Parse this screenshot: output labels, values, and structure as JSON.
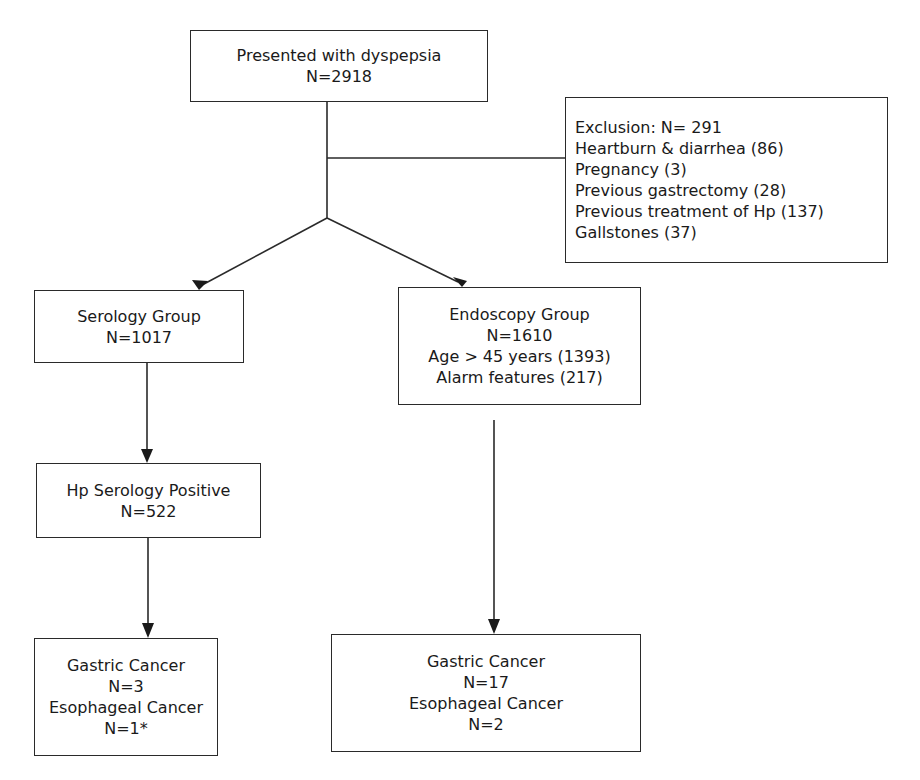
{
  "diagram": {
    "type": "flowchart",
    "nodes": {
      "start": {
        "lines": [
          "Presented with dyspepsia",
          "N=2918"
        ]
      },
      "exclusion": {
        "lines": [
          "Exclusion: N= 291",
          "Heartburn & diarrhea (86)",
          "Pregnancy (3)",
          "Previous gastrectomy (28)",
          "Previous treatment of Hp (137)",
          "Gallstones (37)"
        ]
      },
      "serology_group": {
        "lines": [
          "Serology Group",
          "N=1017"
        ]
      },
      "endoscopy_group": {
        "lines": [
          "Endoscopy Group",
          "N=1610",
          "Age > 45 years (1393)",
          "Alarm features (217)"
        ]
      },
      "hp_positive": {
        "lines": [
          "Hp Serology Positive",
          "N=522"
        ]
      },
      "serology_outcome": {
        "lines": [
          "Gastric Cancer",
          "N=3",
          "Esophageal Cancer",
          "N=1*"
        ]
      },
      "endoscopy_outcome": {
        "lines": [
          "Gastric Cancer",
          "N=17",
          "Esophageal Cancer",
          "N=2"
        ]
      }
    },
    "edges": [
      {
        "from": "start",
        "to": "exclusion",
        "style": "line"
      },
      {
        "from": "start",
        "to": "serology_group",
        "style": "arrow"
      },
      {
        "from": "start",
        "to": "endoscopy_group",
        "style": "arrow"
      },
      {
        "from": "serology_group",
        "to": "hp_positive",
        "style": "arrow"
      },
      {
        "from": "hp_positive",
        "to": "serology_outcome",
        "style": "arrow"
      },
      {
        "from": "endoscopy_group",
        "to": "endoscopy_outcome",
        "style": "arrow"
      }
    ],
    "colors": {
      "line": "#2a2a2a",
      "background": "#ffffff",
      "text": "#1a1a1a"
    }
  }
}
